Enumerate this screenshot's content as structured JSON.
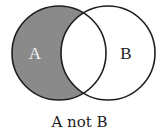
{
  "diagram": {
    "type": "venn",
    "caption": "A not B",
    "sets": [
      {
        "id": "A",
        "label": "A",
        "shaded_region": true
      },
      {
        "id": "B",
        "label": "B",
        "shaded_region": false
      }
    ],
    "highlighted_region": "A minus B",
    "colors": {
      "shade": "#8a8a8a",
      "stroke": "#1e1e1e",
      "label_on_shade": "#f2f2f2",
      "label_default": "#222222",
      "background": "#ffffff"
    }
  }
}
